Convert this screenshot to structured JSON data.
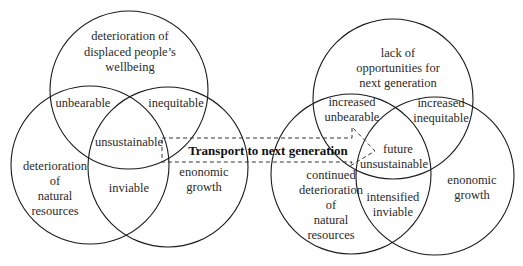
{
  "diagram": {
    "left_venn": {
      "circles": [
        {
          "id": "wellbeing",
          "cx": 129,
          "cy": 90,
          "r": 79,
          "label_lines": [
            "deterioration of",
            "displaced people’s",
            "wellbeing"
          ]
        },
        {
          "id": "natural",
          "cx": 90,
          "cy": 165,
          "r": 79,
          "label_lines": [
            "deterioration",
            "of",
            "natural",
            "resources"
          ]
        },
        {
          "id": "economic",
          "cx": 168,
          "cy": 167,
          "r": 80,
          "label_lines": [
            "enonomic",
            "growth"
          ]
        }
      ],
      "intersections": {
        "wellbeing_natural": "unbearable",
        "wellbeing_economic": "inequitable",
        "natural_economic": "inviable",
        "center": "unsustainable"
      }
    },
    "right_venn": {
      "circles": [
        {
          "id": "opportunities",
          "cx": 393,
          "cy": 99,
          "r": 80,
          "label_lines": [
            "lack of",
            "opportunities for",
            "next generation"
          ]
        },
        {
          "id": "natural",
          "cx": 351,
          "cy": 174,
          "r": 80,
          "label_lines": [
            "continued",
            "deterioration",
            "of",
            "natural",
            "resources"
          ]
        },
        {
          "id": "economic",
          "cx": 435,
          "cy": 176,
          "r": 79,
          "label_lines": [
            "enonomic",
            "growth"
          ]
        }
      ],
      "intersections": {
        "opportunities_natural": [
          "increased",
          "unbearable"
        ],
        "opportunities_economic": [
          "increased",
          "inequitable"
        ],
        "natural_economic": [
          "intensified",
          "inviable"
        ],
        "center": [
          "future",
          "unsustainable"
        ]
      }
    },
    "arrow": {
      "label": "Transport to next generation",
      "style": "dashed"
    }
  }
}
